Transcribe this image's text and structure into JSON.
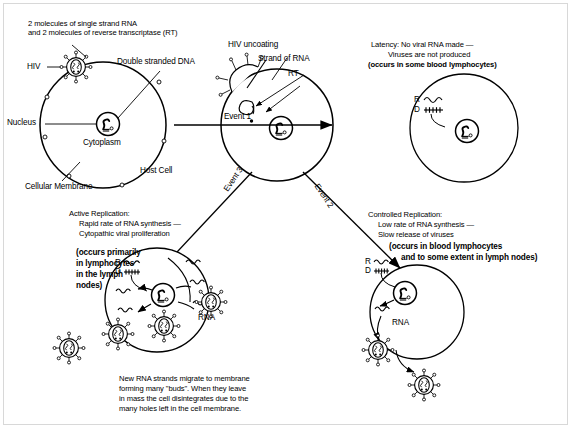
{
  "diagram": {
    "type": "biological-process-flowchart",
    "stroke_color": "#000000",
    "background_color": "#ffffff"
  },
  "labels": {
    "rna_rt_note": "2 molecules of single strand RNA\nand 2 molecules of reverse transcriptase (RT)",
    "hiv": "HIV",
    "double_stranded_dna": "Double stranded DNA",
    "nucleus": "Nucleus",
    "cytoplasm": "Cytoplasm",
    "host_cell": "Host Cell",
    "cellular_membrane": "Cellular Membrane",
    "hiv_uncoating": "HIV uncoating",
    "strand_of_rna": "Strand of RNA",
    "rt": "RT",
    "rna_left": "RNA",
    "rna_right": "RNA"
  },
  "events": {
    "event1": "Event 1",
    "event2": "Event 2",
    "event3": "Event 3"
  },
  "outcomes": {
    "latency": {
      "line1": "Latency: No viral RNA made —",
      "line2": "Viruses are not produced",
      "line3": "(occurs in some blood lymphocytes)"
    },
    "active_replication": {
      "line1": "Active Replication:",
      "line2": "Rapid rate of RNA synthesis —",
      "line3": "Cytopathic viral proliferation",
      "paren1": "(occurs primarily",
      "paren2": "in lymphocytes",
      "paren3": "in the lymph",
      "paren4": "nodes)"
    },
    "controlled_replication": {
      "line1": "Controlled Replication:",
      "line2": "Low rate of RNA synthesis —",
      "line3": "Slow release of viruses",
      "paren1": "(occurs in blood lymphocytes",
      "paren2": "and to some extent in lymph nodes)"
    }
  },
  "caption": {
    "line1": "New RNA strands migrate to membrane",
    "line2": "forming many \"buds\". When they leave",
    "line3": "in mass the cell disintegrates due to the",
    "line4": "many holes left in the cell membrane."
  },
  "nucleus_key": {
    "rna_symbol": "R",
    "dna_symbol": "D"
  },
  "icons": {
    "virion": "hiv-virion-icon",
    "nucleus": "cell-nucleus-icon",
    "rna_strand": "rna-squiggle-icon",
    "dna_strand": "dna-ladder-icon",
    "arrow": "arrow-icon"
  }
}
